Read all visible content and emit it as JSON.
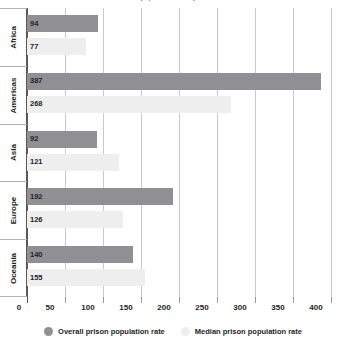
{
  "chart_data": {
    "type": "bar",
    "orientation": "horizontal",
    "title": "Prison population rate by continent",
    "categories": [
      "Africa",
      "Americas",
      "Asia",
      "Europe",
      "Oceania"
    ],
    "series": [
      {
        "name": "Overall prison population rate",
        "key": "overall",
        "color": "#909092",
        "values": [
          94,
          387,
          92,
          192,
          140
        ]
      },
      {
        "name": "Median prison population rate",
        "key": "median",
        "color": "#eeeeee",
        "values": [
          77,
          268,
          121,
          126,
          155
        ]
      }
    ],
    "xlabel": "",
    "ylabel": "",
    "xlim": [
      0,
      400
    ],
    "xticks": [
      0,
      50,
      100,
      150,
      200,
      250,
      300,
      350,
      400
    ],
    "xtick_labels": [
      "0",
      "50",
      "100",
      "150",
      "200",
      "250",
      "300",
      "350",
      "400"
    ],
    "grid": "vertical",
    "legend_position": "bottom",
    "value_labels": true
  },
  "axis": {
    "tick_labels": [
      "0",
      "50",
      "100",
      "150",
      "200",
      "250",
      "300",
      "350",
      "400"
    ]
  },
  "categories": [
    {
      "label": "Africa",
      "overall": "94",
      "median": "77"
    },
    {
      "label": "Americas",
      "overall": "387",
      "median": "268"
    },
    {
      "label": "Asia",
      "overall": "92",
      "median": "121"
    },
    {
      "label": "Europe",
      "overall": "192",
      "median": "126"
    },
    {
      "label": "Oceania",
      "overall": "140",
      "median": "155"
    }
  ],
  "legend": {
    "items": [
      {
        "label": "Overall prison population rate",
        "color": "#909092"
      },
      {
        "label": "Median prison population rate",
        "color": "#eeeeee"
      }
    ]
  },
  "colors": {
    "overall_bar": "#909092",
    "median_bar": "#eeeeee",
    "gridline": "#c9c9c9",
    "axis": "#58585a",
    "text": "#231f20"
  }
}
